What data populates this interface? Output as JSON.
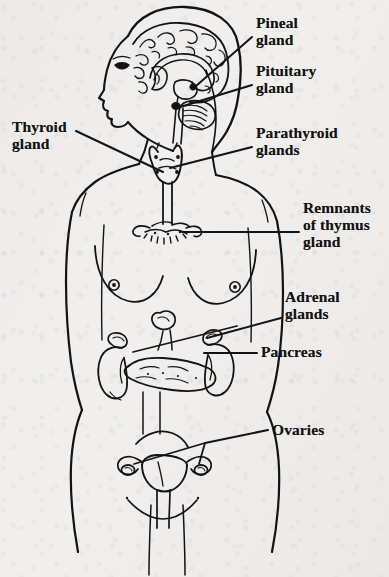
{
  "diagram": {
    "view": "anterior body with lateral head profile",
    "ink_color": "#131313",
    "paper_color": "#f1efed"
  },
  "labels": [
    {
      "id": "pineal",
      "name": "pineal-gland-label",
      "lines": [
        "Pineal",
        "gland"
      ],
      "x": 256,
      "y": 18,
      "anchor": "left",
      "target": "pineal gland in brain"
    },
    {
      "id": "pituitary",
      "name": "pituitary-gland-label",
      "lines": [
        "Pituitary",
        "gland"
      ],
      "x": 256,
      "y": 66,
      "anchor": "left",
      "target": "pituitary gland in brain"
    },
    {
      "id": "thyroid",
      "name": "thyroid-gland-label",
      "lines": [
        "Thyroid",
        "gland"
      ],
      "x": 12,
      "y": 122,
      "anchor": "right",
      "target": "thyroid gland at neck"
    },
    {
      "id": "parathyroid",
      "name": "parathyroid-glands-label",
      "lines": [
        "Parathyroid",
        "glands"
      ],
      "x": 256,
      "y": 128,
      "anchor": "left",
      "target": "parathyroid glands behind thyroid"
    },
    {
      "id": "thymus",
      "name": "thymus-gland-label",
      "lines": [
        "Remnants",
        "of thymus",
        "gland"
      ],
      "x": 303,
      "y": 203,
      "anchor": "left",
      "target": "remnants of thymus gland"
    },
    {
      "id": "adrenal",
      "name": "adrenal-glands-label",
      "lines": [
        "Adrenal",
        "glands"
      ],
      "x": 285,
      "y": 292,
      "anchor": "left",
      "target": "adrenal glands atop kidneys"
    },
    {
      "id": "pancreas",
      "name": "pancreas-label",
      "lines": [
        "Pancreas"
      ],
      "x": 261,
      "y": 345,
      "anchor": "left",
      "target": "pancreas"
    },
    {
      "id": "ovaries",
      "name": "ovaries-label",
      "lines": [
        "Ovaries"
      ],
      "x": 272,
      "y": 423,
      "anchor": "left",
      "target": "ovaries beside uterus"
    }
  ],
  "organs": [
    {
      "id": "brain",
      "name": "brain-cross-section"
    },
    {
      "id": "cerebellum",
      "name": "cerebellum"
    },
    {
      "id": "pineal",
      "name": "pineal-gland"
    },
    {
      "id": "pituitary",
      "name": "pituitary-gland"
    },
    {
      "id": "thyroid",
      "name": "thyroid-gland"
    },
    {
      "id": "trachea",
      "name": "trachea"
    },
    {
      "id": "thymus",
      "name": "thymus-gland"
    },
    {
      "id": "kidneys",
      "name": "kidneys"
    },
    {
      "id": "adrenals",
      "name": "adrenal-glands"
    },
    {
      "id": "pancreas",
      "name": "pancreas"
    },
    {
      "id": "uterus",
      "name": "uterus"
    },
    {
      "id": "ovaries",
      "name": "ovaries"
    }
  ]
}
